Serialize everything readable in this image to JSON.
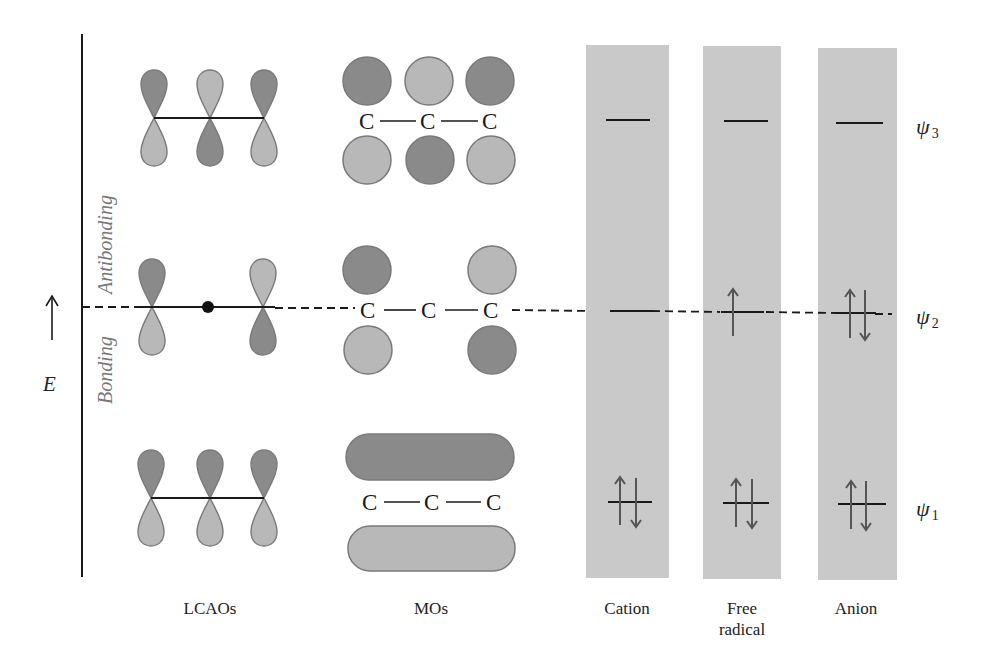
{
  "figure": {
    "axis": {
      "energy_label": "E",
      "region_upper": "Antibonding",
      "region_lower": "Bonding"
    },
    "columns": {
      "lcaos": {
        "label": "LCAOs"
      },
      "mos": {
        "label": "MOs",
        "atom_symbol": "C"
      },
      "cation": {
        "label": "Cation"
      },
      "free_radical": {
        "label_line1": "Free",
        "label_line2": "radical"
      },
      "anion": {
        "label": "Anion"
      }
    },
    "orbitals": [
      {
        "name": "psi3",
        "symbol": "ψ",
        "subscript": "3",
        "type": "antibonding",
        "occupancy": {
          "cation": 0,
          "free_radical": 0,
          "anion": 0
        }
      },
      {
        "name": "psi2",
        "symbol": "ψ",
        "subscript": "2",
        "type": "nonbonding",
        "occupancy": {
          "cation": 0,
          "free_radical": 1,
          "anion": 2
        }
      },
      {
        "name": "psi1",
        "symbol": "ψ",
        "subscript": "1",
        "type": "bonding",
        "occupancy": {
          "cation": 2,
          "free_radical": 2,
          "anion": 2
        }
      }
    ],
    "colors": {
      "dark_lobe": "#8a8a8a",
      "light_lobe": "#b8b8b8",
      "lobe_outline": "#7a7a7a",
      "column_bg": "#c9c9c9",
      "line": "#1a1a1a",
      "arrow": "#555555"
    }
  }
}
